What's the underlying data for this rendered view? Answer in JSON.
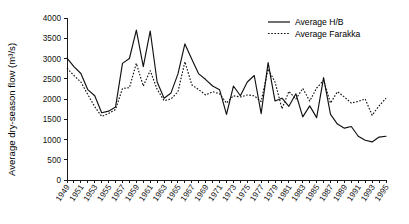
{
  "chart_data": {
    "type": "line",
    "title": "",
    "subtitle": "",
    "xlabel": "",
    "ylabel": "Average dry-season flow (m³/s)",
    "ylim": [
      0,
      4000
    ],
    "ytick_labels": [
      "0",
      "500",
      "1000",
      "1500",
      "2000",
      "2500",
      "3000",
      "3500",
      "4000"
    ],
    "ytick_values": [
      0,
      500,
      1000,
      1500,
      2000,
      2500,
      3000,
      3500,
      4000
    ],
    "grid": false,
    "legend_position": "top-right",
    "x": [
      1949,
      1950,
      1951,
      1952,
      1953,
      1954,
      1955,
      1956,
      1957,
      1958,
      1959,
      1960,
      1961,
      1962,
      1963,
      1964,
      1965,
      1966,
      1967,
      1968,
      1969,
      1970,
      1971,
      1972,
      1973,
      1974,
      1975,
      1976,
      1977,
      1978,
      1979,
      1980,
      1981,
      1982,
      1983,
      1984,
      1985,
      1986,
      1987,
      1988,
      1989,
      1990,
      1991,
      1992,
      1993,
      1994,
      1995
    ],
    "xtick_labels": [
      "1949",
      "1951",
      "1953",
      "1955",
      "1957",
      "1959",
      "1961",
      "1963",
      "1965",
      "1967",
      "1969",
      "1971",
      "1973",
      "1975",
      "1977",
      "1979",
      "1981",
      "1983",
      "1985",
      "1987",
      "1989",
      "1991",
      "1993",
      "1995"
    ],
    "xtick_values": [
      1949,
      1951,
      1953,
      1955,
      1957,
      1959,
      1961,
      1963,
      1965,
      1967,
      1969,
      1971,
      1973,
      1975,
      1977,
      1979,
      1981,
      1983,
      1985,
      1987,
      1989,
      1991,
      1993,
      1995
    ],
    "series": [
      {
        "name": "Average H/B",
        "style": "solid",
        "color": "#111111",
        "values": [
          3010,
          2800,
          2630,
          2230,
          2080,
          1660,
          1700,
          1800,
          2880,
          3000,
          3700,
          2800,
          3680,
          2420,
          2020,
          2150,
          2620,
          3360,
          2980,
          2620,
          2480,
          2320,
          2230,
          1620,
          2320,
          2080,
          2420,
          2580,
          1640,
          2900,
          1950,
          2020,
          1820,
          2130,
          1560,
          1830,
          1540,
          2530,
          1620,
          1380,
          1280,
          1320,
          1080,
          980,
          940,
          1060,
          1080
        ]
      },
      {
        "name": "Average Farakka",
        "style": "dotted",
        "color": "#111111",
        "values": [
          2760,
          2580,
          2420,
          2110,
          1810,
          1570,
          1640,
          1740,
          2260,
          2280,
          2880,
          2320,
          2700,
          2240,
          1960,
          2000,
          2180,
          2920,
          2350,
          2230,
          2100,
          2180,
          2130,
          1900,
          2080,
          2050,
          2100,
          2080,
          1940,
          2740,
          2420,
          1760,
          2190,
          2000,
          2260,
          1950,
          2270,
          2460,
          1900,
          2180,
          2050,
          1900,
          1940,
          2000,
          1600,
          1830,
          2020
        ]
      }
    ],
    "legend": [
      {
        "label": "Average H/B",
        "style": "solid"
      },
      {
        "label": "Average Farakka",
        "style": "dotted"
      }
    ]
  },
  "layout": {
    "plot_left": 67,
    "plot_right": 386,
    "plot_top": 18,
    "plot_bottom": 180
  }
}
